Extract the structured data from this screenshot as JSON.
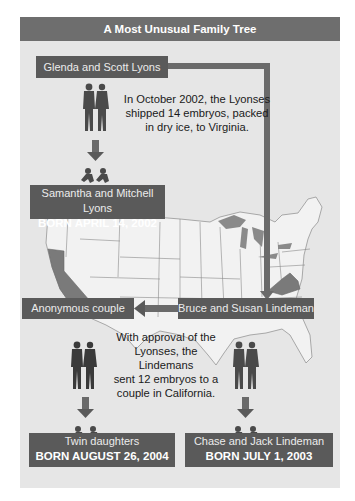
{
  "title": "A Most Unusual Family Tree",
  "colors": {
    "frame_bg": "#e6e6e6",
    "header_bg": "#6e6e6e",
    "box_bg": "#5a5a5a",
    "highlight_state": "#7a7a7a",
    "silhouette": "#4a4a4a"
  },
  "nodes": {
    "glenda_scott": {
      "label": "Glenda and Scott Lyons"
    },
    "samantha_mitchell": {
      "line1": "Samantha and Mitchell Lyons",
      "line2": "BORN APRIL 14, 2002"
    },
    "anonymous_couple": {
      "label": "Anonymous couple"
    },
    "bruce_susan": {
      "label": "Bruce and Susan Lindeman"
    },
    "twin_daughters": {
      "line1": "Twin daughters",
      "line2": "BORN AUGUST 26, 2004"
    },
    "chase_jack": {
      "line1": "Chase and Jack Lindeman",
      "line2": "BORN JULY 1, 2003"
    }
  },
  "captions": {
    "shipment": [
      "In October 2002, the Lyonses",
      "shipped 14 embryos, packed",
      "in dry ice, to Virginia."
    ],
    "approval": [
      "With approval of the",
      "Lyonses, the Lindemans",
      "sent 12 embryos to a",
      "couple in California."
    ]
  },
  "map": {
    "region": "Continental United States",
    "highlighted_states": [
      "California",
      "Virginia"
    ]
  }
}
